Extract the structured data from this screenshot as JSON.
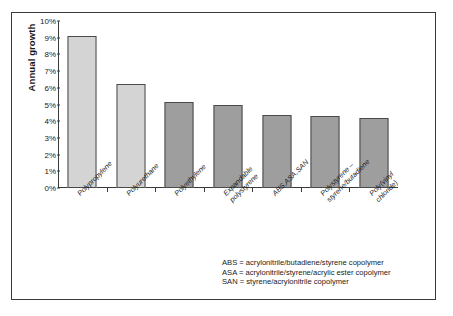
{
  "chart_data": {
    "type": "bar",
    "title": "",
    "xlabel": "",
    "ylabel": "Annual growth",
    "ylim": [
      0,
      10
    ],
    "ytick_labels": [
      "10%",
      "9%",
      "8%",
      "7%",
      "6%",
      "5%",
      "4%",
      "3%",
      "2%",
      "1%",
      "0%"
    ],
    "ytick_values": [
      10,
      9,
      8,
      7,
      6,
      5,
      4,
      3,
      2,
      1,
      0
    ],
    "grid": false,
    "legend_position": "bottom-right",
    "categories": [
      "Polypropylene",
      "Polyurethane",
      "Polyethylene",
      "Expandable polystyrene",
      "ABS,ASA,SAN",
      "Polystyrene – styrene/butadiene",
      "Poly(vinyl chloride)"
    ],
    "values": [
      9.1,
      6.25,
      5.15,
      4.95,
      4.35,
      4.3,
      4.2
    ],
    "bar_colors": [
      "#d4d4d4",
      "#d4d4d4",
      "#9e9e9e",
      "#9e9e9e",
      "#9e9e9e",
      "#9e9e9e",
      "#9e9e9e"
    ],
    "annotations": [
      "ABS = acrylonitrile/butadiene/styrene copolymer",
      "ASA = acrylonitrile/styrene/acrylic ester copolymer",
      "SAN = styrene/acrylonitrile copolymer"
    ]
  },
  "axis": {
    "y_title": "Annual growth"
  },
  "x_label_lines": [
    [
      "Polypropylene"
    ],
    [
      "Polyurethane"
    ],
    [
      "Polyethylene"
    ],
    [
      "Expandable",
      "polystyrene"
    ],
    [
      "ABS,ASA,SAN"
    ],
    [
      "Polystyrene –",
      "styrene/butadiene"
    ],
    [
      "Poly(vinyl",
      "chloride)"
    ]
  ],
  "legend": {
    "lines": [
      "ABS = acrylonitrile/butadiene/styrene copolymer",
      "ASA = acrylonitrile/styrene/acrylic ester copolymer",
      "SAN = styrene/acrylonitrile copolymer"
    ]
  },
  "colors": {
    "bar_light": "#d4d4d4",
    "bar_dark": "#9e9e9e",
    "axis": "#3a3a3a",
    "text": "#1a1a1a",
    "frame": "#3a3a3a",
    "background": "#ffffff"
  }
}
